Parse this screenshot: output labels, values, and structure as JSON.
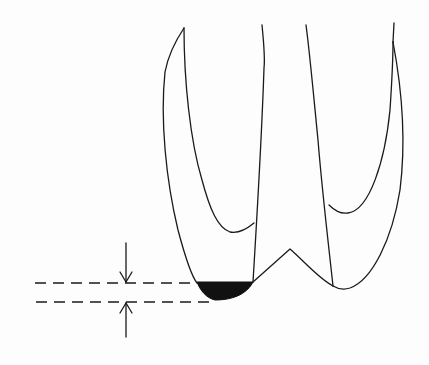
{
  "diagram": {
    "description": "Line drawing of a two-rooted tooth crown cross-section with a blackened cusp tip region and dimension arrows indicating the height of the removed/reduced portion",
    "colors": {
      "background": "#fdfdfd",
      "stroke": "#1a1a1a",
      "fill_region": "#111111"
    },
    "elements": {
      "tooth_outline": "tooth-outline",
      "shaded_region": "cusp-reduction-region",
      "dimension_lines": [
        "upper-dashed-line",
        "lower-dashed-line"
      ],
      "arrows": [
        "down-arrow",
        "up-arrow"
      ]
    }
  }
}
